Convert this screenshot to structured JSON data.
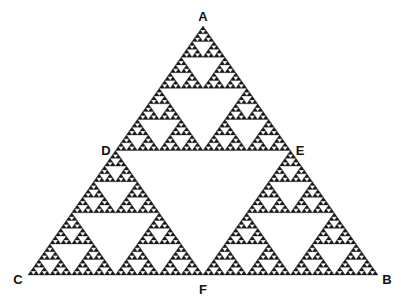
{
  "diagram": {
    "type": "sierpinski-triangle",
    "depth": 6,
    "fill_color": "#1a1a1a",
    "background_color": "#ffffff",
    "vertices": {
      "A": [
        203,
        26
      ],
      "C": [
        28,
        275
      ],
      "B": [
        378,
        275
      ]
    },
    "labels": [
      {
        "text": "A",
        "x": 203,
        "y": 21,
        "anchor": "middle"
      },
      {
        "text": "D",
        "x": 106,
        "y": 155,
        "anchor": "middle"
      },
      {
        "text": "E",
        "x": 300,
        "y": 155,
        "anchor": "middle"
      },
      {
        "text": "C",
        "x": 18,
        "y": 284,
        "anchor": "middle"
      },
      {
        "text": "B",
        "x": 387,
        "y": 284,
        "anchor": "middle"
      },
      {
        "text": "F",
        "x": 203,
        "y": 294,
        "anchor": "middle"
      }
    ]
  }
}
